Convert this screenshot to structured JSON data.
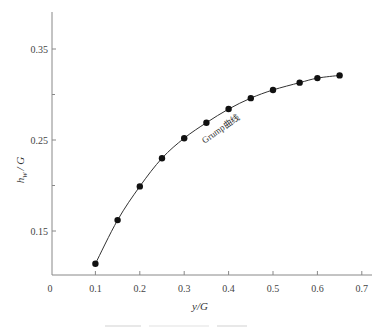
{
  "chart_data": {
    "type": "line",
    "title": "",
    "xlabel": "y/G",
    "ylabel": "h_w / G",
    "ylabel_main": "h",
    "ylabel_sub": "w",
    "ylabel_rest": "/ G",
    "xlim": [
      0,
      0.7
    ],
    "ylim": [
      0.1,
      0.4
    ],
    "x_ticks": [
      0,
      0.1,
      0.2,
      0.3,
      0.4,
      0.5,
      0.6,
      0.7
    ],
    "x_tick_labels": [
      "0",
      "0.1",
      "0.2",
      "0.3",
      "0.4",
      "0.5",
      "0.6",
      "0.7"
    ],
    "y_ticks_major": [
      0.15,
      0.25,
      0.35
    ],
    "y_tick_labels": [
      "0.15",
      "0.25",
      "0.35"
    ],
    "y_ticks_minor": [
      0.2,
      0.3
    ],
    "grid": false,
    "legend": null,
    "annotations": [
      {
        "text": "Grump曲线",
        "x": 0.31,
        "y": 0.235,
        "rotation": -35
      }
    ],
    "series": [
      {
        "name": "Grump曲线",
        "marker": "filled-circle",
        "x": [
          0.1,
          0.15,
          0.2,
          0.25,
          0.3,
          0.35,
          0.4,
          0.45,
          0.5,
          0.56,
          0.6,
          0.65
        ],
        "y": [
          0.114,
          0.162,
          0.199,
          0.23,
          0.252,
          0.269,
          0.284,
          0.296,
          0.305,
          0.313,
          0.318,
          0.321
        ]
      }
    ]
  },
  "colors": {
    "axis": "#888888",
    "line": "#333333",
    "marker": "#111111"
  }
}
